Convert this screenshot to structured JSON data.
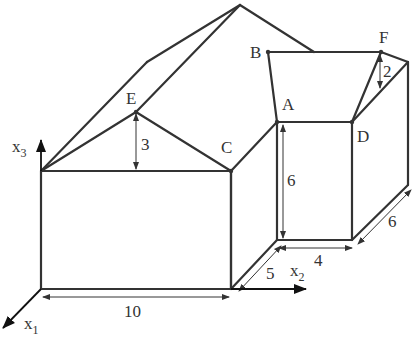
{
  "diagram": {
    "type": "3d-building-sketch",
    "points": {
      "A": "A",
      "B": "B",
      "C": "C",
      "D": "D",
      "E": "E",
      "F": "F"
    },
    "axes": {
      "x1": {
        "base": "x",
        "sub": "1"
      },
      "x2": {
        "base": "x",
        "sub": "2"
      },
      "x3": {
        "base": "x",
        "sub": "3"
      }
    },
    "dimensions": {
      "front_width": "10",
      "side_depth": "5",
      "box_width": "4",
      "box_depth": "6",
      "box_height": "6",
      "gable_height": "3",
      "roof_drop": "2"
    },
    "colors": {
      "line": "#333333",
      "background": "#ffffff"
    }
  }
}
